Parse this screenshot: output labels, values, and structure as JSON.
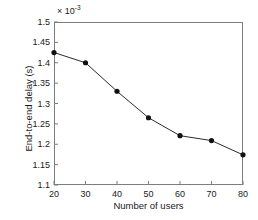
{
  "chart_data": {
    "type": "line",
    "title": "",
    "subtitle": "",
    "xlabel": "Number of users",
    "ylabel": "End-to-end delay (s)",
    "y_multiplier_text": "× 10",
    "y_multiplier_exponent": "-3",
    "y_scale": 0.001,
    "x": [
      20,
      30,
      40,
      50,
      60,
      70,
      80
    ],
    "values": [
      0.001425,
      0.0014,
      0.00133,
      0.001265,
      0.001221,
      0.001209,
      0.001174
    ],
    "values_scaled": [
      1.425,
      1.4,
      1.33,
      1.265,
      1.221,
      1.209,
      1.174
    ],
    "xlim": [
      20,
      80
    ],
    "ylim": [
      1.1,
      1.5
    ],
    "xticks": [
      20,
      30,
      40,
      50,
      60,
      70,
      80
    ],
    "xtick_labels": [
      "20",
      "30",
      "40",
      "50",
      "60",
      "70",
      "80"
    ],
    "yticks": [
      1.1,
      1.15,
      1.2,
      1.25,
      1.3,
      1.35,
      1.4,
      1.45,
      1.5
    ],
    "ytick_labels": [
      "1.1",
      "1.15",
      "1.2",
      "1.25",
      "1.3",
      "1.35",
      "1.4",
      "1.45",
      "1.5"
    ],
    "grid": false,
    "legend": null,
    "legend_position": "none",
    "annotations": [],
    "series": [
      {
        "name": "End-to-end delay",
        "marker": "filled-circle",
        "marker_color": "#111111",
        "line_color": "#2b2b2b",
        "values": [
          1.425,
          1.4,
          1.33,
          1.265,
          1.221,
          1.209,
          1.174
        ]
      }
    ],
    "colors": {
      "line": "#2b2b2b",
      "marker": "#111111",
      "axis": "#7d7d7d",
      "text": "#1a1a1a",
      "background": "#ffffff"
    }
  }
}
